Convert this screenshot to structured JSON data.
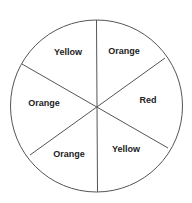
{
  "spinner": {
    "center": [
      96.5,
      106
    ],
    "radius": 86,
    "stroke": "#555555",
    "sections": [
      {
        "label": "Orange",
        "x": 124,
        "y": 54
      },
      {
        "label": "Red",
        "x": 148,
        "y": 103
      },
      {
        "label": "Yellow",
        "x": 126,
        "y": 152
      },
      {
        "label": "Orange",
        "x": 69,
        "y": 157
      },
      {
        "label": "Orange",
        "x": 44,
        "y": 106
      },
      {
        "label": "Yellow",
        "x": 68,
        "y": 55
      }
    ]
  }
}
